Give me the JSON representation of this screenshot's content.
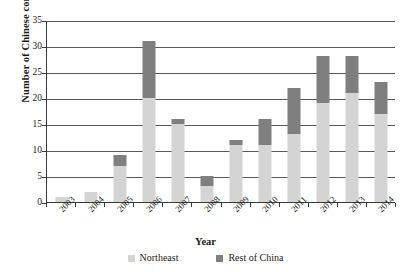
{
  "chart_data": {
    "type": "bar",
    "stacked": true,
    "title": "",
    "xlabel": "Year",
    "ylabel": "Number of Chinese companies",
    "categories": [
      "2003",
      "2004",
      "2005",
      "2006",
      "2007",
      "2008",
      "2009",
      "2010",
      "2011",
      "2012",
      "2013",
      "2014"
    ],
    "series": [
      {
        "name": "Northeast",
        "color": "#d4d4d4",
        "values": [
          1,
          2,
          7,
          20,
          15,
          3,
          11,
          11,
          13,
          19,
          21,
          17
        ]
      },
      {
        "name": "Rest of China",
        "color": "#7f7f7f",
        "values": [
          0,
          0,
          2,
          11,
          1,
          2,
          1,
          5,
          9,
          9,
          7,
          6
        ]
      }
    ],
    "totals": [
      1,
      2,
      9,
      31,
      16,
      5,
      12,
      16,
      22,
      28,
      28,
      23
    ],
    "ylim": [
      0,
      35
    ],
    "ytick_values": [
      0,
      5,
      10,
      15,
      20,
      25,
      30,
      35
    ],
    "ytick_labels": [
      "0",
      "5",
      "10",
      "15",
      "20",
      "25",
      "30",
      "35"
    ],
    "grid": true,
    "legend_position": "bottom"
  },
  "legend": {
    "items": [
      {
        "label": "Northeast",
        "color": "#d4d4d4"
      },
      {
        "label": "Rest of China",
        "color": "#7f7f7f"
      }
    ]
  },
  "axes": {
    "x_title": "Year",
    "y_title": "Number of Chinese companies"
  }
}
